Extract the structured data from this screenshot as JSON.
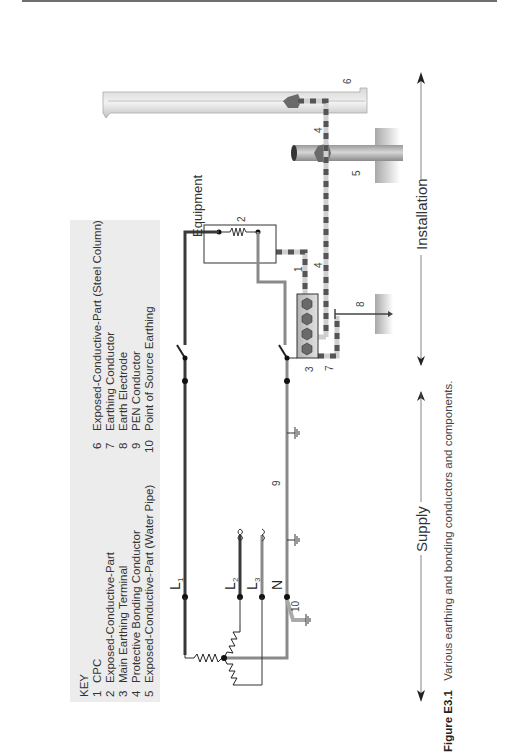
{
  "figure": {
    "caption_label": "Figure E3.1",
    "caption_text": "Various earthing and bonding conductors and components.",
    "orientation": "rotated 90° counter-clockwise (landscape on portrait page)"
  },
  "key": {
    "title": "KEY",
    "items": [
      {
        "num": "1",
        "label": "CPC"
      },
      {
        "num": "2",
        "label": "Exposed-Conductive-Part"
      },
      {
        "num": "3",
        "label": "Main Earthing Terminal"
      },
      {
        "num": "4",
        "label": "Protective Bonding Conductor"
      },
      {
        "num": "5",
        "label": "Exposed-Conductive-Part (Water Pipe)"
      },
      {
        "num": "6",
        "label": "Exposed-Conductive-Part (Steel Column)"
      },
      {
        "num": "7",
        "label": "Earthing Conductor"
      },
      {
        "num": "8",
        "label": "Earth Electrode"
      },
      {
        "num": "9",
        "label": "PEN Conductor"
      },
      {
        "num": "10",
        "label": "Point of Source Earthing"
      }
    ]
  },
  "diagram": {
    "equipment_label": "Equipment",
    "lines": {
      "l1": "L",
      "l1_sub": "1",
      "l2": "L",
      "l2_sub": "2",
      "l3": "L",
      "l3_sub": "3",
      "n": "N"
    },
    "callouts": {
      "c1": "1",
      "c2": "2",
      "c3": "3",
      "c4a": "4",
      "c4b": "4",
      "c5": "5",
      "c6": "6",
      "c7": "7",
      "c8": "8",
      "c9": "9",
      "c10": "10"
    },
    "zones": {
      "supply": "Supply",
      "installation": "Installation"
    }
  },
  "colors": {
    "phase_dark": "#3a3a3a",
    "neutral_grey": "#8a8a8a",
    "bonding_light": "#c8c8c8",
    "bonding_stripe": "#555555",
    "key_bg": "#ececec",
    "hex_fill": "#6a6a6a"
  }
}
